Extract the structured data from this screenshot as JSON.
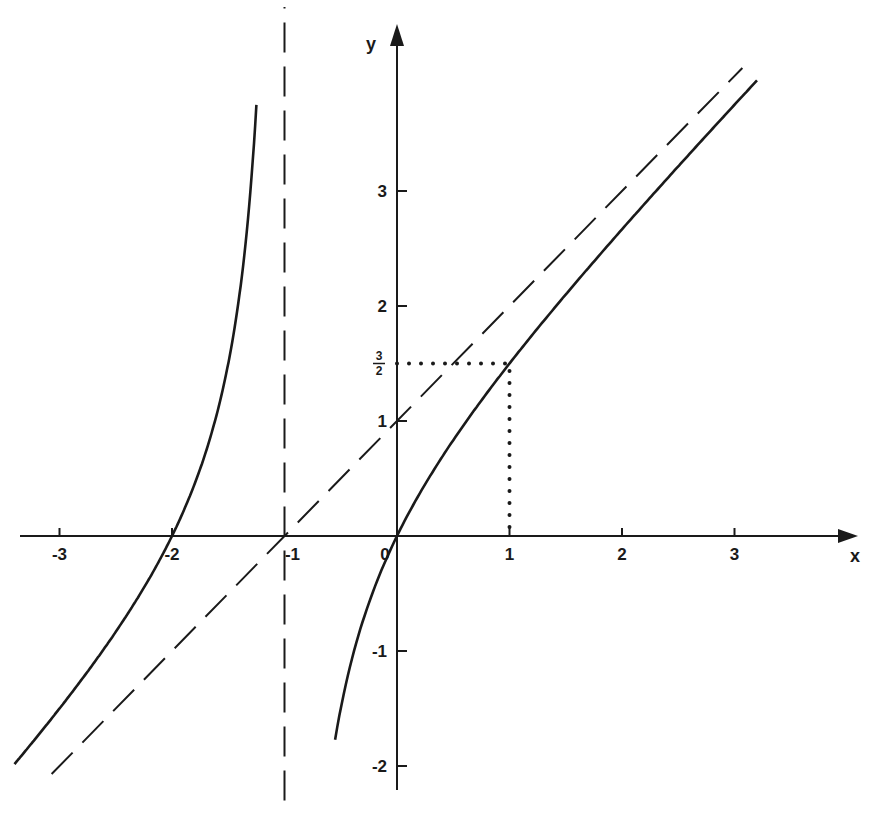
{
  "chart_data": {
    "type": "line",
    "title": "",
    "function": "y = x(x+2)/(x+1)",
    "xlabel": "x",
    "ylabel": "y",
    "xlim": [
      -3.5,
      4.0
    ],
    "ylim": [
      -2.2,
      4.6
    ],
    "grid": false,
    "legend": "none",
    "x_ticks": [
      {
        "value": -3,
        "label": "-3"
      },
      {
        "value": -2,
        "label": "-2"
      },
      {
        "value": -1,
        "label": "-1"
      },
      {
        "value": 0,
        "label": "0"
      },
      {
        "value": 1,
        "label": "1"
      },
      {
        "value": 2,
        "label": "2"
      },
      {
        "value": 3,
        "label": "3"
      }
    ],
    "y_ticks": [
      {
        "value": 3,
        "label": "3"
      },
      {
        "value": 2,
        "label": "2"
      },
      {
        "value": 1,
        "label": "1"
      },
      {
        "value": -1,
        "label": "-1"
      },
      {
        "value": -2,
        "label": "-2"
      }
    ],
    "special_tick": {
      "value": 1.5,
      "numerator": "3",
      "denominator": "2"
    },
    "series": [
      {
        "name": "left branch",
        "style": "solid",
        "x": [
          -3.4,
          -3.0,
          -2.5,
          -2.0,
          -1.75,
          -1.5,
          -1.35,
          -1.25
        ],
        "y": [
          -2.02,
          -1.5,
          -0.83,
          0.0,
          0.58,
          1.5,
          2.51,
          3.75
        ]
      },
      {
        "name": "right branch",
        "style": "solid",
        "x": [
          -0.55,
          -0.5,
          -0.25,
          0.0,
          0.5,
          1.0,
          2.0,
          3.0,
          3.2
        ],
        "y": [
          -2.03,
          -1.5,
          -0.58,
          0.0,
          0.83,
          1.5,
          2.67,
          3.75,
          3.96
        ]
      },
      {
        "name": "vertical asymptote x = -1",
        "style": "dashed",
        "x": [
          -1,
          -1
        ],
        "y": [
          -2.3,
          4.6
        ]
      },
      {
        "name": "oblique asymptote y = x + 1",
        "style": "dashed",
        "x": [
          -3.07,
          3.07
        ],
        "y": [
          -2.07,
          4.07
        ]
      },
      {
        "name": "guide to point (1, 3/2)",
        "style": "dotted",
        "x": [
          0,
          1,
          1
        ],
        "y": [
          1.5,
          1.5,
          0
        ]
      }
    ],
    "annotations": [
      {
        "text": "3/2",
        "at": [
          0,
          1.5
        ]
      }
    ]
  },
  "axes": {
    "x_name": "x",
    "y_name": "y"
  },
  "colors": {
    "ink": "#1a1a1a",
    "background": "#ffffff"
  }
}
